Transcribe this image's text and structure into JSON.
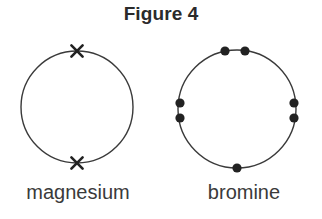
{
  "figure": {
    "title": "Figure 4",
    "background_color": "#ffffff",
    "stroke_color": "#3a3a3a",
    "mark_color": "#222222",
    "label_color": "#3a3a3a",
    "title_color": "#2b2b2b"
  },
  "diagrams": [
    {
      "id": "magnesium",
      "label": "magnesium",
      "electron_symbol": "cross",
      "electron_count": 2,
      "circle": {
        "cx": 77,
        "cy": 107,
        "r": 56,
        "stroke_width": 1.4
      },
      "electrons": [
        {
          "name": "cross-mark-top",
          "angle_deg": 90,
          "x": 77,
          "y": 51
        },
        {
          "name": "cross-mark-bottom",
          "angle_deg": 270,
          "x": 77,
          "y": 163
        }
      ]
    },
    {
      "id": "bromine",
      "label": "bromine",
      "electron_symbol": "dot",
      "electron_count": 7,
      "circle": {
        "cx": 237,
        "cy": 109,
        "r": 59,
        "stroke_width": 1.4
      },
      "electrons": [
        {
          "name": "dot-top-left",
          "x": 225,
          "y": 51
        },
        {
          "name": "dot-top-right",
          "x": 245,
          "y": 51
        },
        {
          "name": "dot-left-upper",
          "x": 180,
          "y": 103
        },
        {
          "name": "dot-left-lower",
          "x": 180,
          "y": 118
        },
        {
          "name": "dot-right-upper",
          "x": 294,
          "y": 103
        },
        {
          "name": "dot-right-lower",
          "x": 294,
          "y": 118
        },
        {
          "name": "dot-bottom",
          "x": 237,
          "y": 168
        }
      ],
      "dot_radius": 4.6
    }
  ]
}
